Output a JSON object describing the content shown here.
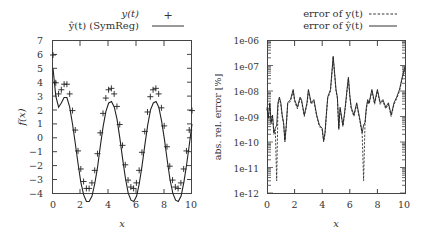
{
  "chart_data": [
    {
      "type": "line",
      "title": "",
      "xlabel": "x",
      "ylabel": "f(x)",
      "xlim": [
        0,
        10
      ],
      "ylim": [
        -4,
        7
      ],
      "x_ticks": [
        "0",
        "2",
        "4",
        "6",
        "8",
        "10"
      ],
      "y_ticks": [
        "-4",
        "-3",
        "-2",
        "-1",
        "0",
        "1",
        "2",
        "3",
        "4",
        "5",
        "6",
        "7"
      ],
      "grid": false,
      "legend_position": "top-right, above plot",
      "series": [
        {
          "name": "y(t)",
          "style": "markers (+)",
          "x": [
            0,
            0.2,
            0.4,
            0.6,
            0.8,
            1.0,
            1.2,
            1.4,
            1.6,
            1.8,
            2.0,
            2.2,
            2.4,
            2.6,
            2.8,
            3.0,
            3.2,
            3.4,
            3.6,
            3.8,
            4.0,
            4.2,
            4.4,
            4.6,
            4.8,
            5.0,
            5.2,
            5.4,
            5.6,
            5.8,
            6.0,
            6.2,
            6.4,
            6.6,
            6.8,
            7.0,
            7.2,
            7.4,
            7.6,
            7.8,
            8.0,
            8.2,
            8.4,
            8.6,
            8.8,
            9.0,
            9.2,
            9.4,
            9.6,
            9.8,
            10.0
          ],
          "values": [
            6.0,
            4.0,
            3.2,
            3.5,
            3.9,
            3.9,
            3.2,
            2.0,
            0.6,
            -0.9,
            -2.2,
            -3.1,
            -3.6,
            -3.6,
            -3.2,
            -2.3,
            -1.1,
            0.4,
            1.8,
            2.9,
            3.5,
            3.6,
            3.2,
            2.3,
            1.0,
            -0.5,
            -1.9,
            -3.0,
            -3.5,
            -3.6,
            -3.2,
            -2.3,
            -1.0,
            0.5,
            1.9,
            3.0,
            3.5,
            3.6,
            3.2,
            2.2,
            0.9,
            -0.6,
            -2.0,
            -3.0,
            -3.5,
            -3.6,
            -3.2,
            -2.2,
            -0.9,
            0.6,
            2.0
          ]
        },
        {
          "name": "ŷ(t) (SymReg)",
          "style": "solid line",
          "x": "same as y(t)",
          "values": "overlaps y(t)"
        }
      ]
    },
    {
      "type": "line",
      "title": "",
      "xlabel": "x",
      "ylabel": "abs. rel. error [%]",
      "yscale": "log",
      "xlim": [
        0,
        10
      ],
      "ylim": [
        1e-12,
        1e-06
      ],
      "x_ticks": [
        "0",
        "2",
        "4",
        "6",
        "8",
        "10"
      ],
      "y_ticks": [
        "1e-12",
        "1e-11",
        "1e-10",
        "1e-09",
        "1e-08",
        "1e-07",
        "1e-06"
      ],
      "grid": false,
      "legend_position": "top-right, above plot",
      "series": [
        {
          "name": "error of y(t)",
          "style": "dashed",
          "x": [
            0,
            0.1,
            0.2,
            0.3,
            0.4,
            0.5,
            0.6,
            0.7,
            0.8,
            0.9,
            1.0,
            1.1,
            1.2,
            1.3,
            1.4,
            1.5,
            1.7,
            1.9,
            2.0,
            2.2,
            2.4,
            2.5,
            2.7,
            2.9,
            3.0,
            3.2,
            3.4,
            3.6,
            3.8,
            4.0,
            4.1,
            4.2,
            4.3,
            4.4,
            4.6,
            4.8,
            5.0,
            5.1,
            5.2,
            5.3,
            5.5,
            5.6,
            5.7,
            5.8,
            5.9,
            6.0,
            6.1,
            6.3,
            6.5,
            6.7,
            6.9,
            7.0,
            7.1,
            7.2,
            7.3,
            7.4,
            7.6,
            7.8,
            8.0,
            8.2,
            8.4,
            8.6,
            8.8,
            9.0,
            9.2,
            9.4,
            9.6,
            9.8,
            10.0
          ],
          "values": [
            2e-09,
            8e-10,
            3e-09,
            5e-10,
            1e-09,
            2e-10,
            3e-10,
            3e-12,
            3e-09,
            5e-09,
            3e-09,
            1e-09,
            5e-10,
            1e-10,
            4e-10,
            3e-09,
            4e-09,
            1e-08,
            4e-09,
            2e-09,
            5e-09,
            4e-09,
            1e-09,
            3e-09,
            1e-08,
            3e-09,
            4e-09,
            1e-09,
            4e-10,
            3e-10,
            1e-10,
            2e-10,
            1e-09,
            5e-09,
            1e-08,
            2e-07,
            1e-08,
            5e-09,
            3e-10,
            2e-09,
            4e-10,
            1e-09,
            3e-09,
            1e-08,
            3e-08,
            6e-09,
            2e-09,
            1e-09,
            3e-09,
            8e-10,
            2e-10,
            3e-12,
            5e-10,
            2e-09,
            4e-09,
            3e-09,
            1e-08,
            3e-09,
            1e-08,
            3e-09,
            4e-09,
            2e-09,
            3e-09,
            1e-09,
            3e-09,
            5e-09,
            1e-08,
            3e-08,
            8e-08
          ]
        },
        {
          "name": "error of ŷ(t)",
          "style": "solid",
          "x": "same as error of y(t)",
          "values": "closely follows dashed series except deep dips near x≈0.7, 1.4, 7.1"
        }
      ]
    }
  ],
  "left_plot": {
    "legend": {
      "entry1": "y(t)",
      "entry2": "ŷ(t) (SymReg)"
    },
    "xlabel": "x",
    "ylabel": "f(x)",
    "xticks": [
      "0",
      "2",
      "4",
      "6",
      "8",
      "10"
    ],
    "yticks": [
      "7",
      "6",
      "5",
      "4",
      "3",
      "2",
      "1",
      "0",
      "−1",
      "−2",
      "−3",
      "−4"
    ]
  },
  "right_plot": {
    "legend": {
      "entry1": "error of y(t)",
      "entry2": "error of ŷ(t)"
    },
    "xlabel": "x",
    "ylabel": "abs. rel. error [%]",
    "xticks": [
      "0",
      "2",
      "4",
      "6",
      "8",
      "10"
    ],
    "yticks": [
      "1e-06",
      "1e-07",
      "1e-08",
      "1e-09",
      "1e-10",
      "1e-11",
      "1e-12"
    ]
  }
}
